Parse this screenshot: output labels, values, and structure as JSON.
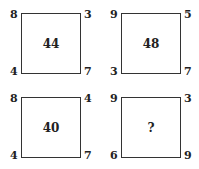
{
  "puzzles": [
    {
      "top_left": "8",
      "top_right": "3",
      "bottom_left": "4",
      "bottom_right": "7",
      "center": "44"
    },
    {
      "top_left": "9",
      "top_right": "5",
      "bottom_left": "3",
      "bottom_right": "7",
      "center": "48"
    },
    {
      "top_left": "8",
      "top_right": "4",
      "bottom_left": "4",
      "bottom_right": "7",
      "center": "40"
    },
    {
      "top_left": "9",
      "top_right": "3",
      "bottom_left": "6",
      "bottom_right": "9",
      "center": "?"
    }
  ]
}
